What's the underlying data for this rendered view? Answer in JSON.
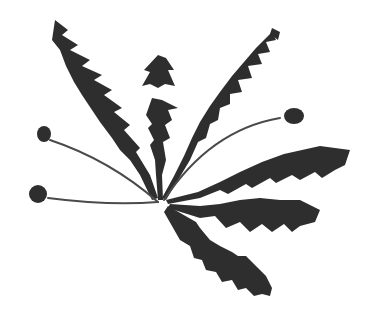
{
  "image": {
    "subject": "dandelion plant illustration",
    "background": "#ffffff",
    "ink": "#2e2e2e",
    "stem": "#4a4a4a"
  }
}
